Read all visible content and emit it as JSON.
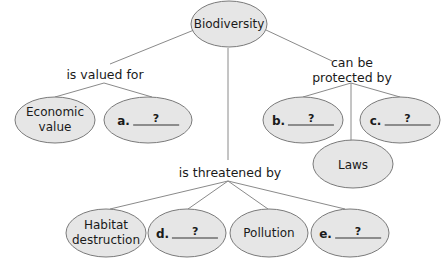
{
  "diagram": {
    "type": "concept-map",
    "colors": {
      "node_fill": "#e6e6e6",
      "node_stroke": "#7a7a7a",
      "line": "#808080",
      "text": "#1a1a1a"
    },
    "root": {
      "id": "biodiversity",
      "label": "Biodiversity"
    },
    "links": {
      "valued": {
        "label": "is valued for"
      },
      "protected": {
        "label_line1": "can be",
        "label_line2": "protected by"
      },
      "threatened": {
        "label": "is threatened by"
      }
    },
    "nodes": {
      "economic": {
        "line1": "Economic",
        "line2": "value"
      },
      "a": {
        "letter": "a.",
        "blank": "?"
      },
      "b": {
        "letter": "b.",
        "blank": "?"
      },
      "c": {
        "letter": "c.",
        "blank": "?"
      },
      "laws": {
        "label": "Laws"
      },
      "habitat": {
        "line1": "Habitat",
        "line2": "destruction"
      },
      "d": {
        "letter": "d.",
        "blank": "?"
      },
      "pollution": {
        "label": "Pollution"
      },
      "e": {
        "letter": "e.",
        "blank": "?"
      }
    }
  }
}
